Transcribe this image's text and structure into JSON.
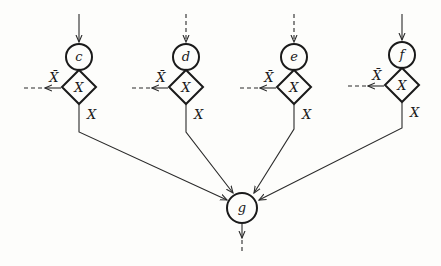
{
  "diagram": {
    "nodes": [
      {
        "id": "c",
        "label": "c",
        "x": 79
      },
      {
        "id": "d",
        "label": "d",
        "x": 186
      },
      {
        "id": "e",
        "label": "e",
        "x": 294
      },
      {
        "id": "f",
        "label": "f",
        "x": 402
      }
    ],
    "decision_label": "X",
    "true_branch_label": "X",
    "false_branch_label": "X̄",
    "sink": {
      "id": "g",
      "label": "g",
      "x": 242,
      "y": 208
    }
  }
}
